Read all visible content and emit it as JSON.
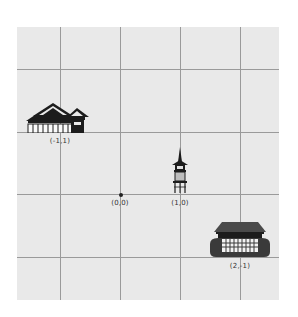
{
  "diagram": {
    "type": "coordinate-grid",
    "grid": {
      "x_lines": [
        -1,
        0,
        1,
        2
      ],
      "y_lines": [
        2,
        1,
        0,
        -1
      ]
    },
    "origin": {
      "label": "(0,0)",
      "x": 0,
      "y": 0
    },
    "points": [
      {
        "id": "temple-hall",
        "icon": "japanese-temple-hall-icon",
        "label": "(-1,1)",
        "x": -1,
        "y": 1
      },
      {
        "id": "pagoda",
        "icon": "pagoda-lantern-icon",
        "label": "(1,0)",
        "x": 1,
        "y": 0
      },
      {
        "id": "stage-temple",
        "icon": "kiyomizu-stage-temple-icon",
        "label": "(2,-1)",
        "x": 2,
        "y": -1
      }
    ]
  },
  "colors": {
    "background": "#e9e9e9",
    "grid": "#9a9a9a",
    "ink": "#222222"
  }
}
